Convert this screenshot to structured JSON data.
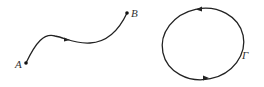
{
  "diagram": {
    "left_figure": {
      "description": "oriented curve from A to B",
      "start_label": "A",
      "end_label": "B",
      "stroke_color": "#222222"
    },
    "right_figure": {
      "description": "closed oriented curve, counterclockwise",
      "label": "Γ",
      "stroke_color": "#222222"
    }
  }
}
